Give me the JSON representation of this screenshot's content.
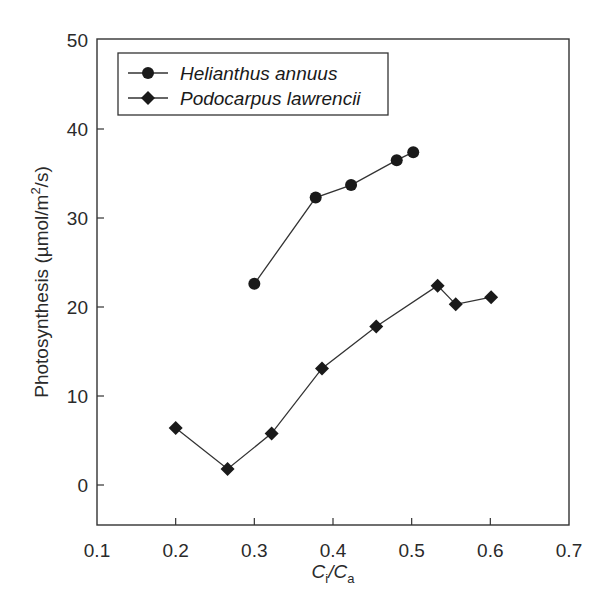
{
  "chart_data": {
    "type": "line",
    "title": "",
    "xlabel_main": "C",
    "xlabel_sub1": "i",
    "xlabel_sep": "/C",
    "xlabel_sub2": "a",
    "xlabel": "Ci/Ca",
    "ylabel": "Photosynthesis (µmol/m²/s)",
    "ylabel_main": "Photosynthesis (µmol/m",
    "ylabel_sup": "2",
    "ylabel_end": "/s)",
    "xlim": [
      0.1,
      0.7
    ],
    "ylim": [
      -4.5,
      50
    ],
    "xticks": [
      0.1,
      0.2,
      0.3,
      0.4,
      0.5,
      0.6,
      0.7
    ],
    "xtick_labels": [
      "0.1",
      "0.2",
      "0.3",
      "0.4",
      "0.5",
      "0.6",
      "0.7"
    ],
    "yticks": [
      0,
      10,
      20,
      30,
      40,
      50
    ],
    "ytick_labels": [
      "0",
      "10",
      "20",
      "30",
      "40",
      "50"
    ],
    "grid": false,
    "legend_position": "top-left",
    "series": [
      {
        "name": "Helianthus annuus",
        "marker": "circle",
        "x": [
          0.3,
          0.378,
          0.423,
          0.481,
          0.502
        ],
        "y": [
          22.6,
          32.3,
          33.7,
          36.5,
          37.4
        ]
      },
      {
        "name": "Podocarpus lawrencii",
        "marker": "diamond",
        "x": [
          0.2,
          0.266,
          0.322,
          0.386,
          0.455,
          0.533,
          0.556,
          0.601
        ],
        "y": [
          6.4,
          1.8,
          5.8,
          13.1,
          17.8,
          22.4,
          20.3,
          21.1
        ]
      }
    ]
  }
}
